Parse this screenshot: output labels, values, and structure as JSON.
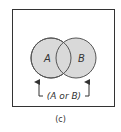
{
  "figure": {
    "caption": "(c)",
    "sets": [
      {
        "label": "A",
        "cx": 51,
        "cy": 58,
        "r": 20
      },
      {
        "label": "B",
        "cx": 76,
        "cy": 58,
        "r": 20
      }
    ],
    "union_label": "(A or B)",
    "colors": {
      "fill": "#d9d9d9",
      "stroke": "#555555",
      "frame": "#333333",
      "text": "#333333"
    }
  }
}
